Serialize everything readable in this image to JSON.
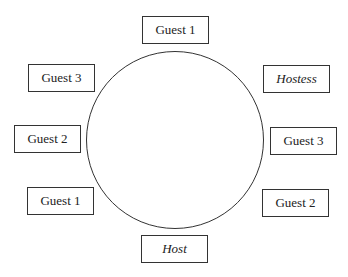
{
  "diagram": {
    "type": "round-table-seating",
    "seats": [
      {
        "id": "top",
        "label": "Guest 1",
        "italic": false,
        "x": 142,
        "y": 16
      },
      {
        "id": "upper-left",
        "label": "Guest 3",
        "italic": false,
        "x": 28,
        "y": 64
      },
      {
        "id": "left",
        "label": "Guest 2",
        "italic": false,
        "x": 14,
        "y": 125
      },
      {
        "id": "lower-left",
        "label": "Guest 1",
        "italic": false,
        "x": 27,
        "y": 187
      },
      {
        "id": "bottom",
        "label": "Host",
        "italic": true,
        "x": 141,
        "y": 235
      },
      {
        "id": "upper-right",
        "label": "Hostess",
        "italic": true,
        "x": 263,
        "y": 65
      },
      {
        "id": "right",
        "label": "Guest 3",
        "italic": false,
        "x": 270,
        "y": 127
      },
      {
        "id": "lower-right",
        "label": "Guest 2",
        "italic": false,
        "x": 262,
        "y": 189
      }
    ]
  }
}
